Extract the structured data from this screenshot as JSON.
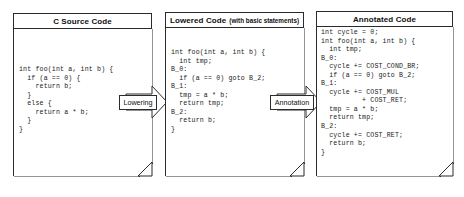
{
  "diagram": {
    "background_color": "#ffffff",
    "line_color": "#2b2b2b",
    "text_color": "#101010"
  },
  "panels": [
    {
      "id": "c-source-code",
      "title": "C Source Code",
      "subtitle": "",
      "code": "int foo(int a, int b) {\n  if (a == 0) {\n    return b;\n  }\n  else {\n    return a * b;\n  }\n}"
    },
    {
      "id": "lowered-code",
      "title": "Lowered Code",
      "subtitle": "(with basic statements)",
      "code": "int foo(int a, int b) {\n  int tmp;\nB_0:\n  if (a == 0) goto B_2;\nB_1:\n  tmp = a * b;\n  return tmp;\nB_2:\n  return b;\n}"
    },
    {
      "id": "annotated-code",
      "title": "Annotated Code",
      "subtitle": "",
      "code": "int cycle = 0;\nint foo(int a, int b) {\n  int tmp;\nB_0:\n  cycle += COST_COND_BR;\n  if (a == 0) goto B_2;\nB_1:\n  cycle += COST_MUL\n          + COST_RET;\n  tmp = a * b;\n  return tmp;\nB_2:\n  cycle += COST_RET;\n  return b;\n}"
    }
  ],
  "arrows": [
    {
      "id": "lowering",
      "label": "Lowering"
    },
    {
      "id": "annotation",
      "label": "Annotation"
    }
  ]
}
